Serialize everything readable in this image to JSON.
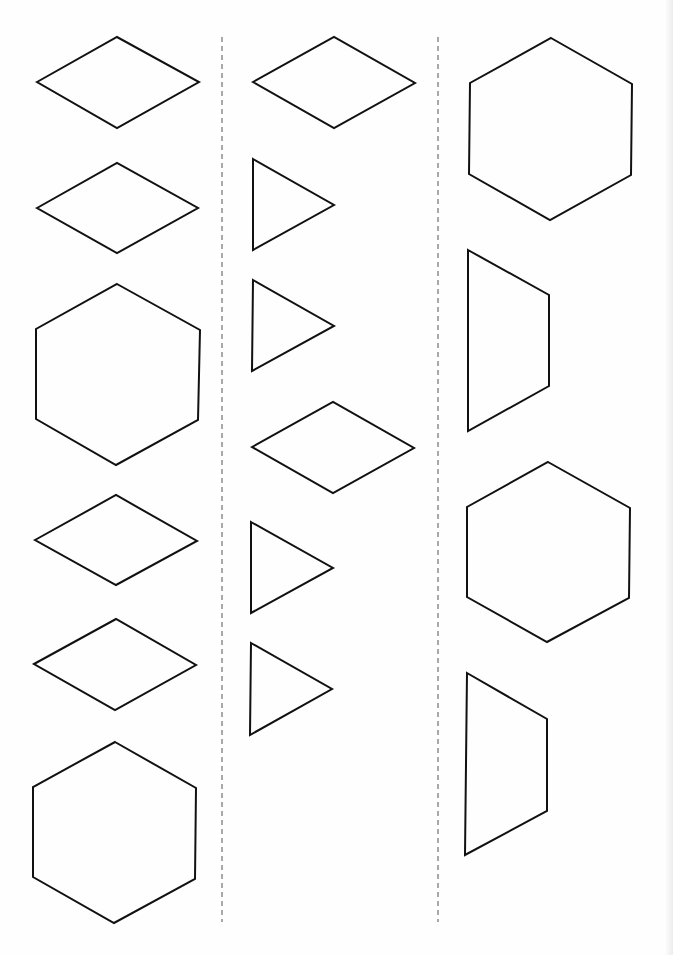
{
  "worksheet": {
    "title": "",
    "stroke_color": "#111111",
    "divider_color": "#555555",
    "background": "#fefefe"
  },
  "dividers": [
    {
      "x": 222,
      "y1": 37,
      "y2": 922
    },
    {
      "x": 438,
      "y1": 37,
      "y2": 922
    }
  ],
  "columns": [
    {
      "name": "left-column",
      "shapes": [
        {
          "type": "rhombus",
          "points": "37,82 117,37 199,82 117,128"
        },
        {
          "type": "rhombus",
          "points": "37,208 117,163 198,208 117,253"
        },
        {
          "type": "hexagon",
          "points": "117,284 200,330 198,420 116,465 36,419 36,329"
        },
        {
          "type": "rhombus",
          "points": "35,540 116,495 197,541 116,585"
        },
        {
          "type": "rhombus",
          "points": "34,664 116,619 196,665 115,710"
        },
        {
          "type": "hexagon",
          "points": "115,742 196,788 195,879 114,923 33,877 33,787"
        }
      ]
    },
    {
      "name": "middle-column",
      "shapes": [
        {
          "type": "rhombus",
          "points": "253,82 334,37 415,83 334,128"
        },
        {
          "type": "triangle",
          "points": "253,159 334,205 253,250"
        },
        {
          "type": "triangle",
          "points": "253,280 334,326 252,371"
        },
        {
          "type": "rhombus",
          "points": "252,447 333,402 414,448 333,493"
        },
        {
          "type": "triangle",
          "points": "251,522 333,568 251,613"
        },
        {
          "type": "triangle",
          "points": "251,643 332,689 250,735"
        }
      ]
    },
    {
      "name": "right-column",
      "shapes": [
        {
          "type": "hexagon",
          "points": "551,38 632,84 631,175 550,220 469,174 470,83"
        },
        {
          "type": "trapezoid",
          "points": "468,250 549,295 549,386 468,431"
        },
        {
          "type": "hexagon",
          "points": "548,462 630,508 629,598 547,642 467,597 467,507"
        },
        {
          "type": "trapezoid",
          "points": "467,673 547,719 547,811 465,855"
        }
      ]
    }
  ]
}
